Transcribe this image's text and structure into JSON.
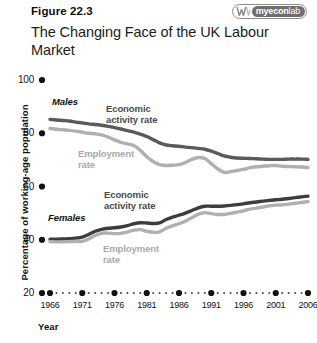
{
  "figure": {
    "number": "Figure 22.3",
    "title": "The Changing Face of the\nUK Labour Market"
  },
  "logo": {
    "mark_name": "myeconlab-w-mark",
    "word_my": "my",
    "word_econ": "econ",
    "word_lab": "lab"
  },
  "chart_data": {
    "type": "line",
    "title": "The Changing Face of the UK Labour Market",
    "xlabel": "Year",
    "ylabel": "Percentage of working-age population",
    "xlim": [
      1966,
      2006
    ],
    "ylim": [
      20,
      100
    ],
    "yticks": [
      "20",
      "40",
      "60",
      "80",
      "100"
    ],
    "ytick_values": [
      20,
      40,
      60,
      80,
      100
    ],
    "xticks": [
      "1966",
      "1971",
      "1976",
      "1981",
      "1986",
      "1991",
      "1996",
      "2001",
      "2006"
    ],
    "xtick_values": [
      1966,
      1971,
      1976,
      1981,
      1986,
      1991,
      1996,
      2001,
      2006
    ],
    "grid": false,
    "legend": "in-plot annotations",
    "annotations": [
      {
        "text": "Males",
        "style": "group"
      },
      {
        "text": "Economic\nactivity rate",
        "style": "dark"
      },
      {
        "text": "Employment\nrate",
        "style": "light"
      },
      {
        "text": "Females",
        "style": "group"
      },
      {
        "text": "Economic\nactivity rate",
        "style": "dark"
      },
      {
        "text": "Employment\nrate",
        "style": "light"
      }
    ],
    "x": [
      1966,
      1967,
      1968,
      1969,
      1970,
      1971,
      1972,
      1973,
      1974,
      1975,
      1976,
      1977,
      1978,
      1979,
      1980,
      1981,
      1982,
      1983,
      1984,
      1985,
      1986,
      1987,
      1988,
      1989,
      1990,
      1991,
      1992,
      1993,
      1994,
      1995,
      1996,
      1997,
      1998,
      1999,
      2000,
      2001,
      2002,
      2003,
      2004,
      2005,
      2006
    ],
    "series": [
      {
        "name": "Males economic activity rate",
        "group": "Males",
        "measure": "Economic activity rate",
        "color": "#5a5a5a",
        "values": [
          85.2,
          85.0,
          84.8,
          84.6,
          84.2,
          83.9,
          83.5,
          83.3,
          83.0,
          82.6,
          82.1,
          81.6,
          81.0,
          80.4,
          79.7,
          78.8,
          77.6,
          76.4,
          75.6,
          75.3,
          75.1,
          74.8,
          74.6,
          74.3,
          74.0,
          73.3,
          72.4,
          71.5,
          71.0,
          70.7,
          70.6,
          70.5,
          70.4,
          70.3,
          70.2,
          70.2,
          70.2,
          70.3,
          70.3,
          70.3,
          70.2
        ]
      },
      {
        "name": "Males employment rate",
        "group": "Males",
        "measure": "Employment rate",
        "color": "#b0b0b0",
        "values": [
          81.8,
          81.5,
          81.3,
          81.1,
          80.8,
          80.4,
          80.0,
          79.8,
          79.4,
          78.6,
          77.5,
          76.6,
          76.0,
          75.4,
          73.6,
          71.2,
          69.4,
          68.2,
          67.9,
          68.0,
          68.2,
          69.0,
          70.2,
          70.9,
          70.5,
          68.6,
          66.6,
          65.3,
          65.6,
          66.0,
          66.4,
          67.1,
          67.4,
          67.6,
          67.8,
          67.9,
          67.6,
          67.5,
          67.4,
          67.3,
          67.1
        ]
      },
      {
        "name": "Females economic activity rate",
        "group": "Females",
        "measure": "Economic activity rate",
        "color": "#3d3d3d",
        "values": [
          40.2,
          40.2,
          40.3,
          40.4,
          40.6,
          41.0,
          42.0,
          43.2,
          43.9,
          44.3,
          44.5,
          44.8,
          45.3,
          46.0,
          46.4,
          46.3,
          46.1,
          46.3,
          47.6,
          48.5,
          49.2,
          50.0,
          51.0,
          52.0,
          52.6,
          52.6,
          52.6,
          52.7,
          52.9,
          53.2,
          53.5,
          53.9,
          54.2,
          54.5,
          54.8,
          55.0,
          55.2,
          55.5,
          55.8,
          56.1,
          56.4
        ]
      },
      {
        "name": "Females employment rate",
        "group": "Females",
        "measure": "Employment rate",
        "color": "#b0b0b0",
        "values": [
          39.3,
          39.2,
          39.2,
          39.3,
          39.4,
          39.4,
          40.3,
          41.6,
          42.4,
          42.5,
          42.3,
          42.4,
          42.9,
          43.6,
          43.8,
          43.2,
          42.8,
          43.0,
          44.3,
          45.2,
          46.0,
          47.0,
          48.3,
          49.6,
          50.2,
          49.8,
          49.5,
          49.5,
          49.9,
          50.4,
          50.9,
          51.5,
          51.9,
          52.3,
          52.7,
          53.0,
          53.1,
          53.4,
          53.7,
          54.0,
          54.3
        ]
      }
    ]
  }
}
